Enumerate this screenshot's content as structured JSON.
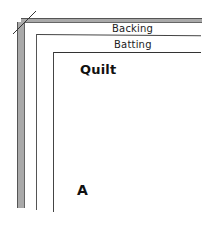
{
  "diagram": {
    "layers": [
      {
        "name": "backing",
        "label": "Backing"
      },
      {
        "name": "batting",
        "label": "Batting"
      },
      {
        "name": "quilt",
        "label": "Quilt"
      }
    ],
    "corner_marker": "A",
    "colors": {
      "backing_band": "#a9a9a9",
      "lines": "#444444",
      "background": "#ffffff"
    }
  }
}
